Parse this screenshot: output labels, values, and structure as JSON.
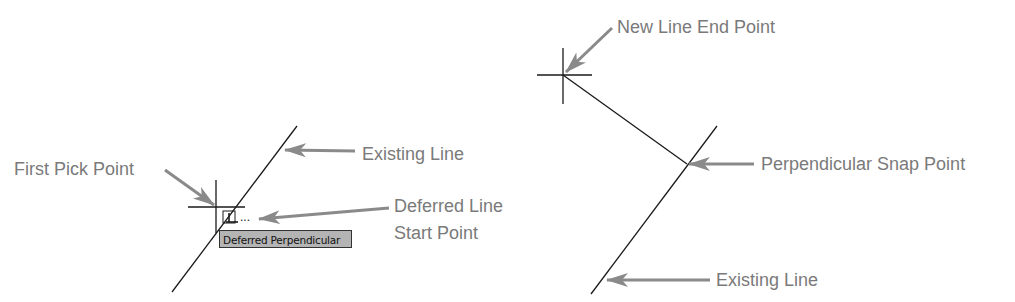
{
  "colors": {
    "geometry": "#1a1a1a",
    "callout": "#8a8a8a",
    "label_text": "#7a7a7a",
    "tooltip_bg": "#b4b4b4",
    "tooltip_border": "#333333"
  },
  "left_panel": {
    "labels": {
      "first_pick_point": "First Pick Point",
      "existing_line": "Existing Line",
      "deferred_line_start_line1": "Deferred Line",
      "deferred_line_start_line2": "Start Point"
    },
    "snap_marker": {
      "icon": "deferred-perpendicular-marker-icon",
      "trailing": "..."
    },
    "tooltip": "Deferred Perpendicular"
  },
  "right_panel": {
    "labels": {
      "new_line_end_point": "New Line End Point",
      "perpendicular_snap_point": "Perpendicular Snap Point",
      "existing_line": "Existing Line"
    }
  }
}
